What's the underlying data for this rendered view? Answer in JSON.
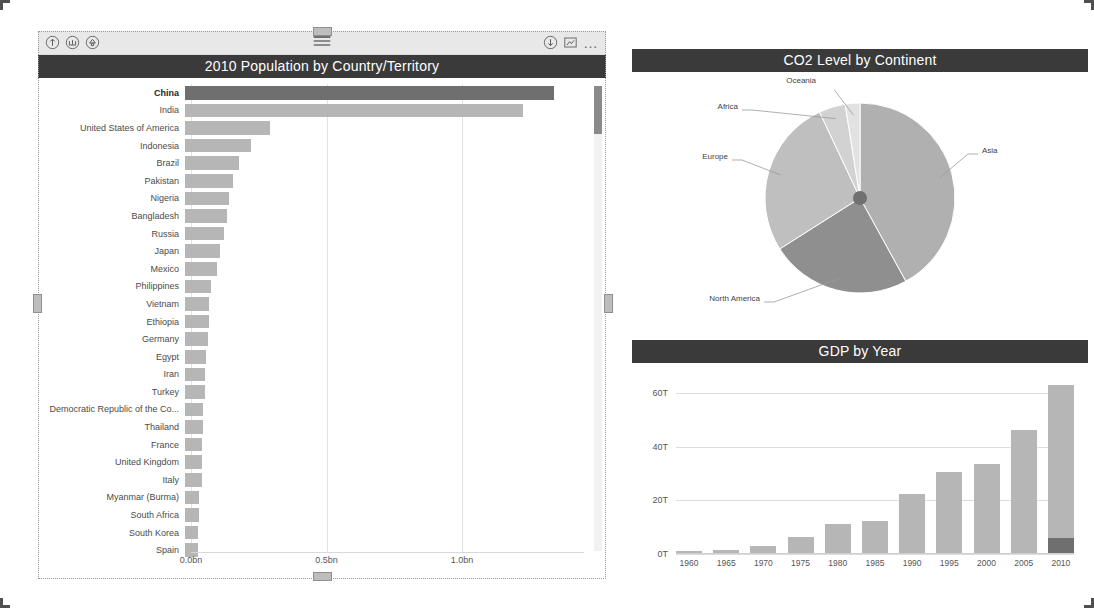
{
  "left_visual": {
    "toolbar": {
      "icons_left": [
        {
          "name": "drill-up-icon",
          "label": "Drill up"
        },
        {
          "name": "expand-hierarchy-icon",
          "label": "Expand all down one level"
        },
        {
          "name": "drill-down-toggle-icon",
          "label": "Drill down"
        }
      ],
      "icons_right": [
        {
          "name": "filter-download-icon",
          "label": "Drill mode"
        },
        {
          "name": "focus-mode-icon",
          "label": "Focus mode"
        },
        {
          "name": "more-options-icon",
          "label": "More options"
        }
      ],
      "drag_grip": "drag-grip"
    },
    "title": "2010 Population by Country/Territory"
  },
  "pie_visual": {
    "title": "CO2 Level by Continent"
  },
  "gdp_visual": {
    "title": "GDP by Year"
  },
  "colors": {
    "header_bg": "#3a3a3a",
    "header_text": "#ffffff",
    "bar_default": "#b6b6b6",
    "bar_selected": "#6f6f6f",
    "gridline": "#e2e2e2",
    "toolbar_bg": "#e8e8e8"
  },
  "chart_data": [
    {
      "type": "bar",
      "id": "population-by-country",
      "orientation": "horizontal",
      "title": "2010 Population by Country/Territory",
      "xlabel": "",
      "ylabel": "",
      "xlim": [
        0,
        1.45
      ],
      "xticks": [
        0.0,
        0.5,
        1.0
      ],
      "xtick_labels": [
        "0.0bn",
        "0.5bn",
        "1.0bn"
      ],
      "grid": true,
      "unit": "bn",
      "selected_category": "China",
      "categories": [
        "China",
        "India",
        "United States of America",
        "Indonesia",
        "Brazil",
        "Pakistan",
        "Nigeria",
        "Bangladesh",
        "Russia",
        "Japan",
        "Mexico",
        "Philippines",
        "Vietnam",
        "Ethiopia",
        "Germany",
        "Egypt",
        "Iran",
        "Turkey",
        "Democratic Republic of the Co...",
        "Thailand",
        "France",
        "United Kingdom",
        "Italy",
        "Myanmar (Burma)",
        "South Africa",
        "South Korea",
        "Spain"
      ],
      "values": [
        1.34,
        1.23,
        0.31,
        0.24,
        0.195,
        0.174,
        0.159,
        0.151,
        0.143,
        0.128,
        0.117,
        0.093,
        0.087,
        0.087,
        0.082,
        0.078,
        0.074,
        0.072,
        0.065,
        0.064,
        0.063,
        0.063,
        0.06,
        0.052,
        0.051,
        0.049,
        0.046
      ],
      "scroll": {
        "visible": true,
        "thumb_position": "top"
      }
    },
    {
      "type": "pie",
      "id": "co2-by-continent",
      "title": "CO2 Level by Continent",
      "labels": [
        "Asia",
        "North America",
        "Europe",
        "Africa",
        "Oceania"
      ],
      "values": [
        42.0,
        24.0,
        27.0,
        4.5,
        2.5
      ],
      "legend": "callout-labels",
      "label_positions": [
        "right",
        "bottom-left",
        "left",
        "top-left",
        "top"
      ]
    },
    {
      "type": "bar",
      "id": "gdp-by-year",
      "orientation": "vertical",
      "title": "GDP by Year",
      "xlabel": "",
      "ylabel": "",
      "ylim": [
        0,
        66
      ],
      "yticks": [
        0,
        20,
        40,
        60
      ],
      "ytick_labels": [
        "0T",
        "20T",
        "40T",
        "60T"
      ],
      "grid": true,
      "categories": [
        "1960",
        "1965",
        "1970",
        "1975",
        "1980",
        "1985",
        "1990",
        "1995",
        "2000",
        "2005",
        "2010"
      ],
      "series": [
        {
          "name": "Total GDP",
          "values": [
            1.0,
            1.6,
            3.0,
            6.2,
            11.2,
            12.3,
            22.2,
            30.5,
            33.5,
            46.2,
            63.0
          ]
        },
        {
          "name": "China (highlighted)",
          "values": [
            0,
            0,
            0,
            0,
            0,
            0,
            0,
            0,
            0,
            0,
            6.0
          ]
        }
      ]
    }
  ]
}
